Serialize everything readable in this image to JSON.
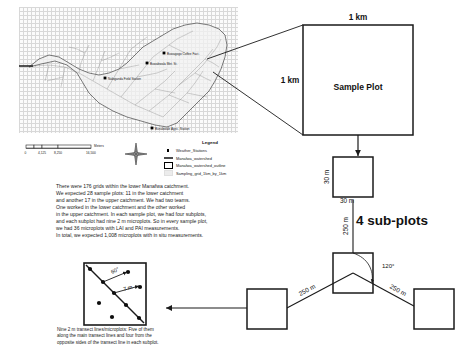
{
  "map": {
    "title": "Manafwa watershed sampling map",
    "stations": [
      {
        "name": "Buwagogo Coffee Fact.",
        "x": 145,
        "y": 46
      },
      {
        "name": "Buwabwala Met. St.",
        "x": 128,
        "y": 56
      },
      {
        "name": "Nabiganda Field Station",
        "x": 86,
        "y": 71
      },
      {
        "name": "Bunabwale Agric. Station",
        "x": 133,
        "y": 121
      }
    ],
    "scalebar": {
      "ticks": [
        "0",
        "4,125",
        "8,250",
        "16,500"
      ],
      "units": "Meters"
    },
    "compass": {
      "label": "N"
    },
    "legend": {
      "title": "Legend",
      "items": [
        {
          "symbol": "point",
          "label": "Weather_Stations"
        },
        {
          "symbol": "line",
          "label": "Manafwa_watershed"
        },
        {
          "symbol": "outline",
          "label": "Manafwa_watershed_outline"
        },
        {
          "symbol": "grid",
          "label": "Sampling_grid_1km_by_1km"
        }
      ]
    }
  },
  "body_text": {
    "lines": [
      "There were 176 grids within the lower Manafwa catchment.",
      "We expected 28 sample plots: 11 in the lower catchment",
      "and another 17 in the upper catchment. We had two teams.",
      "One worked in the lower catchment and the other worked",
      "in the upper catchment. In each sample plot, we had four subplots,",
      "and each subplot had nine 2 m microplots. So in every sample plot,",
      "we had 36 microplots with LAI and PAI measurements.",
      "In total, we expected 1,008 microplots with in situ measurements."
    ]
  },
  "caption": {
    "lines": [
      "Nine 2 m transect lines/microplots: Five of them",
      "along the main transect lines and four from the",
      "opposite sides of the transect line in each subplot."
    ]
  },
  "diagram": {
    "sample_plot": {
      "label": "Sample Plot",
      "width_label": "1 km",
      "height_label": "1 km"
    },
    "subplot": {
      "top_label": "30 m",
      "side_label": "30 m",
      "group_label": "4 sub-plots",
      "angle_label": "120°",
      "spacing_center": "250 m",
      "spacing_left": "250 m",
      "spacing_right": "250 m"
    },
    "microplot": {
      "angle_label": "60°",
      "length_label": "7 m"
    }
  },
  "colors": {
    "line": "#1a1a1a",
    "grid": "#d6d6d6",
    "text": "#1a1a1a",
    "fill": "#ffffff",
    "watershed_fill": "#f2f2f2"
  }
}
